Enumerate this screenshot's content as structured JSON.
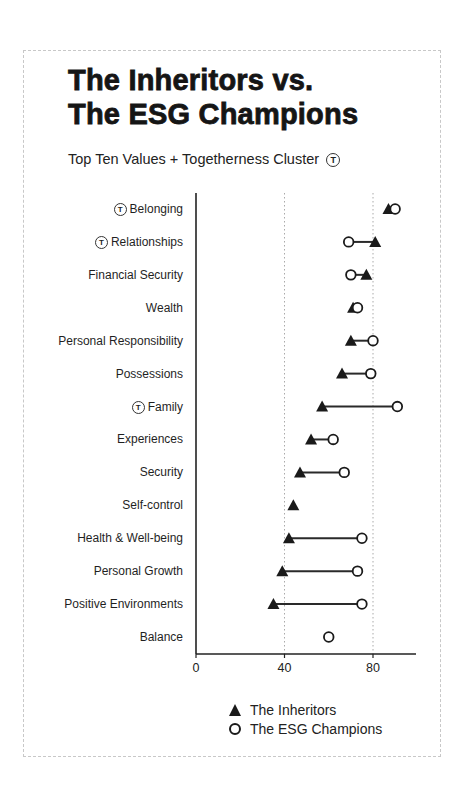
{
  "header": {
    "title_line1": "The Inheritors vs.",
    "title_line2": "The ESG Champions",
    "subtitle": "Top Ten Values + Togetherness Cluster",
    "togetherness_symbol": "T"
  },
  "legend": {
    "inheritors_label": "The Inheritors",
    "esg_label": "The ESG Champions"
  },
  "axis": {
    "ticks": [
      "0",
      "40",
      "80"
    ]
  },
  "chart_data": {
    "type": "dot-plot (dumbbell)",
    "title": "The Inheritors vs. The ESG Champions",
    "subtitle": "Top Ten Values + Togetherness Cluster",
    "xlabel": "",
    "ylabel": "",
    "xlim": [
      0,
      100
    ],
    "xticks": [
      0,
      40,
      80
    ],
    "grid": "vertical dotted lines at 40 and 80",
    "legend_position": "bottom",
    "categories": [
      "Belonging",
      "Relationships",
      "Financial Security",
      "Wealth",
      "Personal Responsibility",
      "Possessions",
      "Family",
      "Experiences",
      "Security",
      "Self-control",
      "Health & Well-being",
      "Personal Growth",
      "Positive Environments",
      "Balance"
    ],
    "togetherness_cluster": [
      "Belonging",
      "Relationships",
      "Family"
    ],
    "series": [
      {
        "name": "The Inheritors",
        "marker": "filled triangle",
        "values": [
          87,
          81,
          77,
          71,
          70,
          66,
          57,
          52,
          47,
          44,
          42,
          39,
          35,
          null
        ]
      },
      {
        "name": "The ESG Champions",
        "marker": "open circle",
        "values": [
          90,
          69,
          70,
          73,
          80,
          79,
          91,
          62,
          67,
          null,
          75,
          73,
          75,
          60
        ]
      }
    ]
  }
}
